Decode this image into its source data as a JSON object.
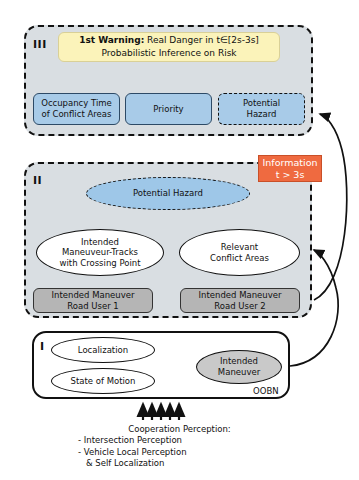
{
  "diagram": {
    "colors": {
      "panel_fill": "#d9dee2",
      "warning_yellow": "#fbf3ba",
      "node_blue": "#a8cbe8",
      "hazard_blue": "#9ec7e8",
      "node_gray": "#b5b5b5",
      "maneuver_gray": "#c9c9c9",
      "badge_orange": "#ef6a40",
      "stroke": "#111111"
    }
  },
  "level3": {
    "numeral": "III",
    "warning": {
      "strong": "1st Warning:",
      "rest": " Real Danger in t∈[2s-3s]",
      "line2": "Probabilistic Inference on Risk"
    },
    "nodes": [
      {
        "label_line1": "Occupancy Time",
        "label_line2": "of Conflict Areas"
      },
      {
        "label_line1": "Priority",
        "label_line2": ""
      },
      {
        "label_line1": "Potential",
        "label_line2": "Hazard"
      }
    ]
  },
  "level2": {
    "numeral": "II",
    "hazard": "Potential Hazard",
    "ellipses": [
      {
        "line1": "Intended",
        "line2": "Maneuveur-Tracks",
        "line3": "with Crossing Point"
      },
      {
        "line1": "Relevant",
        "line2": "Conflict Areas",
        "line3": ""
      }
    ],
    "inputs": [
      {
        "line1": "Intended Maneuver",
        "line2": "Road User 1"
      },
      {
        "line1": "Intended Maneuver",
        "line2": "Road User 2"
      }
    ]
  },
  "level1": {
    "numeral": "I",
    "nodes": [
      {
        "label": "Localization"
      },
      {
        "label": "State of Motion"
      }
    ],
    "output": {
      "line1": "Intended",
      "line2": "Maneuver"
    },
    "framework_label": "OOBN"
  },
  "badge": {
    "line1": "Information",
    "line2": "t > 3s"
  },
  "caption": {
    "heading": "Cooperation Perception:",
    "item1": "- Intersection Perception",
    "item2": "- Vehicle Local Perception",
    "item3": "& Self Localization"
  }
}
